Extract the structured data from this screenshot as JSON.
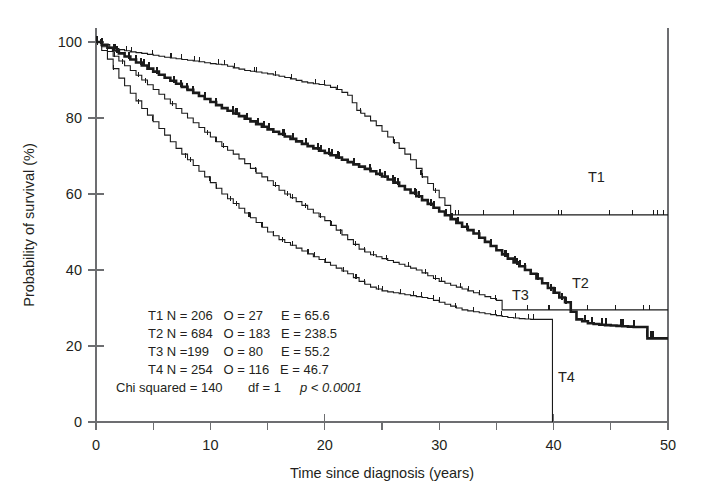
{
  "chart_data": {
    "type": "line",
    "title": "",
    "xlabel": "Time since diagnosis (years)",
    "ylabel": "Probability of survival (%)",
    "xlim": [
      0,
      50
    ],
    "ylim": [
      0,
      100
    ],
    "xticks": [
      0,
      10,
      20,
      30,
      40,
      50
    ],
    "xticks_minor": [
      5,
      15,
      25,
      35,
      45
    ],
    "yticks": [
      0,
      20,
      40,
      60,
      80,
      100
    ],
    "grid": false,
    "legend_position": "inline-right-of-curves",
    "series": [
      {
        "name": "T1",
        "label": "T1",
        "style": "thin",
        "final_value": 54.5,
        "x": [
          0,
          0.6,
          1.2,
          2.0,
          3.0,
          4.0,
          5.0,
          6.0,
          7.0,
          8.0,
          9.0,
          10.0,
          11.0,
          12.0,
          13.0,
          14.0,
          15.0,
          16.0,
          17.0,
          18.0,
          19.0,
          20.0,
          21.0,
          22.0,
          22.8,
          23.5,
          24.5,
          25.5,
          26.5,
          27.5,
          28.5,
          29.5,
          30.5,
          31.0,
          50.0
        ],
        "y": [
          100,
          99.3,
          98.6,
          98.0,
          97.4,
          97.0,
          96.5,
          96.0,
          95.6,
          95.2,
          94.8,
          94.3,
          94.0,
          93.2,
          92.5,
          92.1,
          91.6,
          91.0,
          90.3,
          89.5,
          89.0,
          88.6,
          87.5,
          86.0,
          82.0,
          80.5,
          78.0,
          75.0,
          72.0,
          69.0,
          64.5,
          61.0,
          57.0,
          54.5,
          54.5
        ]
      },
      {
        "name": "T2",
        "label": "T2",
        "style": "bold",
        "final_value": 22.0,
        "x": [
          0,
          1.0,
          2.0,
          3.0,
          4.0,
          5.0,
          6.0,
          7.0,
          8.0,
          9.0,
          10.0,
          11.0,
          12.0,
          13.0,
          14.0,
          15.0,
          16.0,
          17.0,
          18.0,
          19.0,
          20.0,
          21.0,
          22.0,
          23.0,
          24.0,
          25.0,
          26.0,
          27.0,
          28.0,
          29.0,
          30.0,
          31.0,
          32.0,
          33.0,
          34.0,
          35.0,
          36.0,
          37.0,
          38.0,
          39.0,
          40.0,
          41.0,
          41.5,
          42.0,
          43.0,
          44.0,
          45.0,
          46.0,
          47.0,
          47.8,
          48.2,
          50.0
        ],
        "y": [
          100,
          98.5,
          97.0,
          95.4,
          93.8,
          92.2,
          90.6,
          89.0,
          87.4,
          85.8,
          84.2,
          82.6,
          81.2,
          79.8,
          78.4,
          77.0,
          75.8,
          74.5,
          73.2,
          72.0,
          70.8,
          69.6,
          68.4,
          67.2,
          66.0,
          64.6,
          63.0,
          61.2,
          59.4,
          57.4,
          55.4,
          53.4,
          51.4,
          49.6,
          47.4,
          45.2,
          43.0,
          41.0,
          39.0,
          36.5,
          34.0,
          31.5,
          29.0,
          27.0,
          26.0,
          25.6,
          25.4,
          25.2,
          25.0,
          25.0,
          22.0,
          22.0
        ]
      },
      {
        "name": "T3",
        "label": "T3",
        "style": "thin-plateau",
        "final_value": 29.5,
        "x": [
          0,
          1.0,
          2.0,
          3.0,
          4.0,
          5.0,
          6.0,
          7.0,
          8.0,
          9.0,
          10.0,
          11.0,
          12.0,
          13.0,
          14.0,
          15.0,
          16.0,
          17.0,
          18.0,
          19.0,
          20.0,
          21.0,
          22.0,
          23.0,
          24.0,
          25.0,
          26.0,
          27.0,
          28.0,
          29.0,
          30.0,
          31.0,
          32.0,
          33.0,
          34.0,
          35.0,
          35.5,
          50.0
        ],
        "y": [
          100,
          97.5,
          95.0,
          92.5,
          90.0,
          87.5,
          85.0,
          82.5,
          80.0,
          77.5,
          75.0,
          72.5,
          70.5,
          68.0,
          65.5,
          63.5,
          61.0,
          59.0,
          57.0,
          55.0,
          53.0,
          50.5,
          48.0,
          45.5,
          44.0,
          43.0,
          42.0,
          41.0,
          40.0,
          38.5,
          37.0,
          36.0,
          35.0,
          34.0,
          33.0,
          32.0,
          29.5,
          29.5
        ]
      },
      {
        "name": "T4",
        "label": "T4",
        "style": "thin-drop",
        "final_value": 0,
        "x": [
          0,
          1.0,
          2.0,
          3.0,
          4.0,
          5.0,
          6.0,
          7.0,
          8.0,
          9.0,
          10.0,
          11.0,
          12.0,
          13.0,
          14.0,
          15.0,
          16.0,
          17.0,
          18.0,
          19.0,
          20.0,
          21.0,
          22.0,
          23.0,
          24.0,
          25.0,
          26.0,
          27.0,
          28.0,
          29.0,
          30.0,
          31.0,
          32.0,
          33.0,
          34.0,
          35.0,
          36.0,
          37.0,
          38.0,
          39.0,
          39.8,
          39.9
        ],
        "y": [
          100,
          95.5,
          90.5,
          86.5,
          82.5,
          79.0,
          75.5,
          72.0,
          69.0,
          66.0,
          63.0,
          60.0,
          57.5,
          55.0,
          52.5,
          50.0,
          48.0,
          46.5,
          45.0,
          43.5,
          42.0,
          40.5,
          39.0,
          37.0,
          35.5,
          34.5,
          34.0,
          33.5,
          33.0,
          32.5,
          31.5,
          30.5,
          29.5,
          29.0,
          28.5,
          28.0,
          27.5,
          27.2,
          27.0,
          27.0,
          27.0,
          0
        ]
      }
    ],
    "annotations": {
      "rows": [
        {
          "group": "T1",
          "n_label": "N = 206",
          "o_label": "O = 27",
          "e_label": "E = 65.6"
        },
        {
          "group": "T2",
          "n_label": "N = 684",
          "o_label": "O = 183",
          "e_label": "E = 238.5"
        },
        {
          "group": "T3",
          "n_label": "N =199",
          "o_label": "O = 80",
          "e_label": "E = 55.2"
        },
        {
          "group": "T4",
          "n_label": "N = 254",
          "o_label": "O = 116",
          "e_label": "E = 46.7"
        }
      ],
      "chi_squared_label": "Chi squared = 140",
      "df_label": "df = 1",
      "p_value_label": "p < 0.0001"
    }
  },
  "figure": {
    "curve_labels": {
      "t1": "T1",
      "t2": "T2",
      "t3": "T3",
      "t4": "T4"
    },
    "axes": {
      "x_title": "Time since diagnosis (years)",
      "y_title": "Probability of survival (%)",
      "x_tick_labels": [
        "0",
        "10",
        "20",
        "30",
        "40",
        "50"
      ],
      "y_tick_labels": [
        "0",
        "20",
        "40",
        "60",
        "80",
        "100"
      ]
    },
    "stats_block": {
      "line1": "T1 N = 206   O = 27     E = 65.6",
      "line2": "T2 N = 684   O = 183   E = 238.5",
      "line3": "T3 N =199    O = 80     E = 55.2",
      "line4": "T4 N = 254   O = 116   E = 46.7",
      "line5_a": "Chi squared = 140",
      "line5_b": "df = 1",
      "line5_c": "p < 0.0001"
    },
    "colors": {
      "curve": "#1a1a1a",
      "axis": "#6d6e71",
      "text": "#231f20",
      "background": "#ffffff"
    }
  }
}
